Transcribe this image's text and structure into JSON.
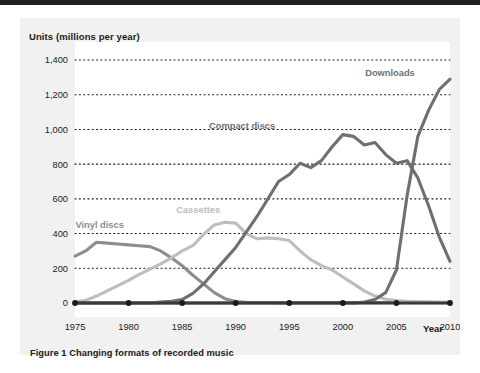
{
  "figure": {
    "caption": "Figure 1 Changing formats of recorded music"
  },
  "axes": {
    "y_title": "Units (millions per year)",
    "x_title": "Year",
    "y_ticks": [
      "0",
      "200",
      "400",
      "600",
      "800",
      "1,000",
      "1,200",
      "1,400"
    ],
    "x_ticks": [
      "1975",
      "1980",
      "1985",
      "1990",
      "1995",
      "2000",
      "2005",
      "2010"
    ]
  },
  "colors": {
    "vinyl": "#8d8d8d",
    "cassettes": "#bdbdbd",
    "compact_discs": "#6f6f6f",
    "downloads": "#6f6f6f",
    "axis": "#3a3a3a",
    "gridline": "#1b1b1b",
    "panel": "#f1f1f1",
    "plot_background": "#ffffff",
    "top_rule": "#221f1f"
  },
  "chart_data": {
    "type": "line",
    "title": "Figure 1 Changing formats of recorded music",
    "xlabel": "Year",
    "ylabel": "Units (millions per year)",
    "xlim": [
      1975,
      2010
    ],
    "ylim": [
      0,
      1400
    ],
    "ytick_values": [
      0,
      200,
      400,
      600,
      800,
      1000,
      1200,
      1400
    ],
    "xtick_values": [
      1975,
      1980,
      1985,
      1990,
      1995,
      2000,
      2005,
      2010
    ],
    "grid": "horizontal-dotted",
    "legend": "inline-labels",
    "x": [
      1975,
      1976,
      1977,
      1978,
      1979,
      1980,
      1981,
      1982,
      1983,
      1984,
      1985,
      1986,
      1987,
      1988,
      1989,
      1990,
      1991,
      1992,
      1993,
      1994,
      1995,
      1996,
      1997,
      1998,
      1999,
      2000,
      2001,
      2002,
      2003,
      2004,
      2005,
      2006,
      2007,
      2008,
      2009,
      2010
    ],
    "series": [
      {
        "name": "Vinyl discs",
        "color": "#8d8d8d",
        "label_x": 1977.3,
        "label_y": 430,
        "values": [
          270,
          300,
          350,
          345,
          340,
          335,
          330,
          325,
          300,
          260,
          215,
          160,
          110,
          60,
          25,
          8,
          4,
          3,
          3,
          2,
          2,
          2,
          2,
          2,
          2,
          2,
          2,
          2,
          2,
          2,
          2,
          2,
          2,
          2,
          2,
          2
        ]
      },
      {
        "name": "Cassettes",
        "color": "#bdbdbd",
        "label_x": 1986.5,
        "label_y": 520,
        "values": [
          5,
          15,
          40,
          70,
          100,
          130,
          165,
          195,
          225,
          260,
          300,
          330,
          395,
          450,
          465,
          460,
          400,
          370,
          375,
          370,
          360,
          300,
          250,
          215,
          190,
          150,
          110,
          70,
          40,
          22,
          14,
          10,
          8,
          7,
          6,
          6
        ]
      },
      {
        "name": "Compact discs",
        "color": "#6f6f6f",
        "label_x": 1990.6,
        "label_y": 1000,
        "values": [
          0,
          0,
          0,
          0,
          0,
          0,
          0,
          0,
          5,
          10,
          20,
          55,
          110,
          180,
          250,
          320,
          410,
          500,
          600,
          700,
          740,
          805,
          780,
          820,
          900,
          970,
          960,
          910,
          925,
          855,
          805,
          820,
          720,
          560,
          380,
          240
        ]
      },
      {
        "name": "Downloads",
        "color": "#6f6f6f",
        "label_x": 2004.4,
        "label_y": 1305,
        "values": [
          0,
          0,
          0,
          0,
          0,
          0,
          0,
          0,
          0,
          0,
          0,
          0,
          0,
          0,
          0,
          0,
          0,
          0,
          0,
          0,
          0,
          0,
          0,
          0,
          0,
          0,
          0,
          5,
          20,
          60,
          190,
          620,
          960,
          1110,
          1230,
          1290
        ]
      }
    ]
  }
}
